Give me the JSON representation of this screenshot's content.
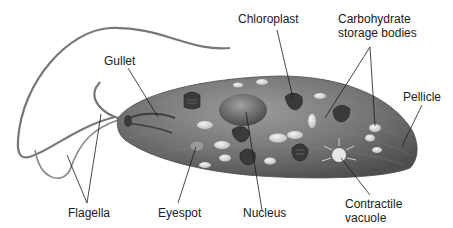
{
  "diagram": {
    "labels": {
      "gullet": "Gullet",
      "chloroplast": "Chloroplast",
      "carbohydrate_line1": "Carbohydrate",
      "carbohydrate_line2": "storage bodies",
      "pellicle": "Pellicle",
      "flagella": "Flagella",
      "eyespot": "Eyespot",
      "nucleus": "Nucleus",
      "contractile_line1": "Contractile",
      "contractile_line2": "vacuole"
    },
    "colors": {
      "cell_body": "#6e6e6e",
      "cell_highlight": "#9a9a9a",
      "organelle_dark": "#3a3a3a",
      "storage_body": "#d8d8d8",
      "leader_line": "#1a1a1a"
    }
  }
}
